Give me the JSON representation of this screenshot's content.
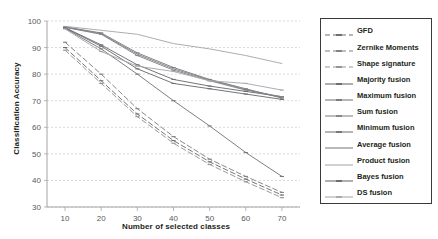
{
  "chart_data": {
    "type": "line",
    "title": "",
    "xlabel": "Number of selected classes",
    "ylabel": "Classification Accuracy",
    "x": [
      10,
      20,
      30,
      40,
      50,
      60,
      70
    ],
    "xlim": [
      5,
      75
    ],
    "ylim": [
      30,
      100
    ],
    "xticks": [
      "10",
      "20",
      "30",
      "40",
      "50",
      "60",
      "70"
    ],
    "yticks": [
      "30",
      "40",
      "50",
      "60",
      "70",
      "80",
      "90",
      "100"
    ],
    "grid": "horizontal-dashed",
    "legend_position": "right",
    "series": [
      {
        "name": "GFD",
        "style": "dashed",
        "color": "#6d6e71",
        "marker": "dash",
        "values": [
          90.0,
          77.5,
          65.0,
          55.0,
          47.0,
          40.5,
          34.5
        ]
      },
      {
        "name": "Zernike Moments",
        "style": "dashed",
        "color": "#808285",
        "marker": "dash",
        "values": [
          92.0,
          80.0,
          67.0,
          56.5,
          48.0,
          41.5,
          35.5
        ]
      },
      {
        "name": "Shape signature",
        "style": "dashed",
        "color": "#939598",
        "marker": "dash",
        "values": [
          89.0,
          76.5,
          64.0,
          54.0,
          46.0,
          39.5,
          33.5
        ]
      },
      {
        "name": "Majority fusion",
        "style": "solid",
        "color": "#6d6e71",
        "marker": "tick",
        "values": [
          97.5,
          91.0,
          83.5,
          78.0,
          75.5,
          73.5,
          71.5
        ]
      },
      {
        "name": "Maximum fusion",
        "style": "solid",
        "color": "#7b7d80",
        "marker": "tick",
        "values": [
          97.8,
          95.5,
          88.0,
          82.5,
          78.0,
          74.5,
          71.0
        ]
      },
      {
        "name": "Sum fusion",
        "style": "solid",
        "color": "#85878a",
        "marker": "tick",
        "values": [
          97.6,
          95.0,
          87.0,
          81.5,
          77.5,
          74.0,
          71.5
        ]
      },
      {
        "name": "Minimum fusion",
        "style": "solid",
        "color": "#76787b",
        "marker": "tick",
        "values": [
          97.2,
          89.5,
          80.0,
          70.0,
          60.5,
          50.5,
          41.5
        ]
      },
      {
        "name": "Average fusion",
        "style": "solid",
        "color": "#808285",
        "marker": "none",
        "values": [
          97.7,
          95.2,
          87.5,
          82.0,
          77.8,
          74.2,
          71.2
        ]
      },
      {
        "name": "Product fusion",
        "style": "solid",
        "color": "#a7a9ac",
        "marker": "none",
        "values": [
          98.0,
          96.5,
          95.0,
          91.5,
          89.5,
          87.0,
          84.0
        ]
      },
      {
        "name": "Bayes fusion",
        "style": "solid",
        "color": "#6d6e71",
        "marker": "tick",
        "values": [
          97.4,
          90.5,
          82.0,
          76.5,
          74.5,
          72.5,
          70.5
        ]
      },
      {
        "name": "DS fusion",
        "style": "solid",
        "color": "#a7a9ac",
        "marker": "tick",
        "values": [
          97.0,
          88.5,
          83.0,
          81.0,
          77.5,
          76.5,
          74.0
        ]
      }
    ]
  }
}
